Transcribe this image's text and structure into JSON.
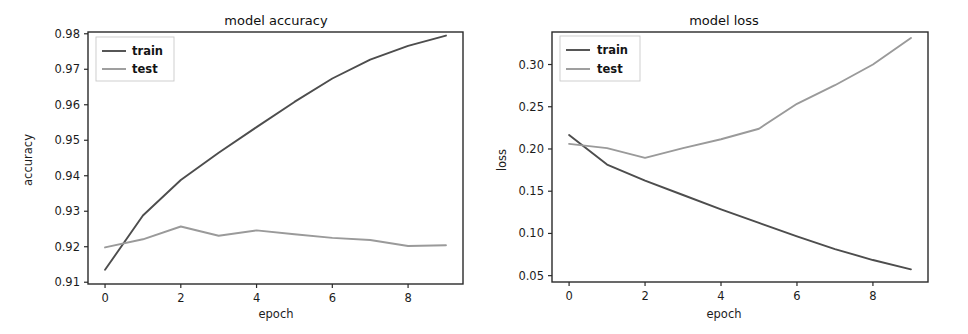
{
  "figure": {
    "background": "#ffffff",
    "panel_count": 2,
    "train_color": "#4d4d4d",
    "test_color": "#9a9a9a"
  },
  "chart_data": [
    {
      "type": "line",
      "id": "model-accuracy",
      "title": "model accuracy",
      "xlabel": "epoch",
      "ylabel": "accuracy",
      "x": [
        0,
        1,
        2,
        3,
        4,
        5,
        6,
        7,
        8,
        9
      ],
      "xlim": [
        -0.45,
        9.45
      ],
      "ylim": [
        0.9095,
        0.9805
      ],
      "xticks": [
        0,
        2,
        4,
        6,
        8
      ],
      "xticklabels": [
        "0",
        "2",
        "4",
        "6",
        "8"
      ],
      "yticks": [
        0.91,
        0.92,
        0.93,
        0.94,
        0.95,
        0.96,
        0.97,
        0.98
      ],
      "yticklabels": [
        "0.91",
        "0.92",
        "0.93",
        "0.94",
        "0.95",
        "0.96",
        "0.97",
        "0.98"
      ],
      "grid": false,
      "legend_position": "upper left",
      "series": [
        {
          "name": "train",
          "color": "#4d4d4d",
          "values": [
            0.9135,
            0.9288,
            0.9388,
            0.9465,
            0.9537,
            0.9608,
            0.9674,
            0.9727,
            0.9766,
            0.9795
          ]
        },
        {
          "name": "test",
          "color": "#9a9a9a",
          "values": [
            0.9198,
            0.9221,
            0.9257,
            0.9231,
            0.9246,
            0.9235,
            0.9225,
            0.9219,
            0.9202,
            0.9204
          ]
        }
      ]
    },
    {
      "type": "line",
      "id": "model-loss",
      "title": "model loss",
      "xlabel": "epoch",
      "ylabel": "loss",
      "x": [
        0,
        1,
        2,
        3,
        4,
        5,
        6,
        7,
        8,
        9
      ],
      "xlim": [
        -0.45,
        9.45
      ],
      "ylim": [
        0.0425,
        0.3385
      ],
      "xticks": [
        0,
        2,
        4,
        6,
        8
      ],
      "xticklabels": [
        "0",
        "2",
        "4",
        "6",
        "8"
      ],
      "yticks": [
        0.05,
        0.1,
        0.15,
        0.2,
        0.25,
        0.3
      ],
      "yticklabels": [
        "0.05",
        "0.10",
        "0.15",
        "0.20",
        "0.25",
        "0.30"
      ],
      "grid": false,
      "legend_position": "upper left",
      "series": [
        {
          "name": "train",
          "color": "#4d4d4d",
          "values": [
            0.2165,
            0.1815,
            0.1625,
            0.1455,
            0.1285,
            0.1125,
            0.0965,
            0.0815,
            0.0685,
            0.0575
          ]
        },
        {
          "name": "test",
          "color": "#9a9a9a",
          "values": [
            0.206,
            0.201,
            0.1895,
            0.201,
            0.2115,
            0.224,
            0.2535,
            0.2755,
            0.3,
            0.3315
          ]
        }
      ]
    }
  ]
}
